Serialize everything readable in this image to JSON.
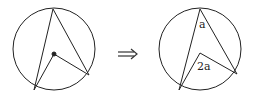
{
  "diagram": {
    "left_figure": {
      "circle": {
        "cx": 54,
        "cy": 49,
        "r": 42
      },
      "vertex_top": [
        53,
        9
      ],
      "point_bottom_left": [
        34,
        90
      ],
      "point_right": [
        89,
        75
      ],
      "center_dot": [
        54,
        54
      ]
    },
    "arrow": {
      "symbol": "⇒",
      "x": 128,
      "y": 54
    },
    "right_figure": {
      "circle": {
        "cx": 200,
        "cy": 49,
        "r": 42
      },
      "vertex_top": [
        200,
        9
      ],
      "point_bottom_left": [
        179,
        90
      ],
      "point_right": [
        237,
        74
      ],
      "center_vertex": [
        200,
        53
      ],
      "labels": {
        "inscribed_angle": "a",
        "central_angle": "2a"
      }
    },
    "colors": {
      "stroke": "#222222",
      "background": "#ffffff"
    }
  }
}
